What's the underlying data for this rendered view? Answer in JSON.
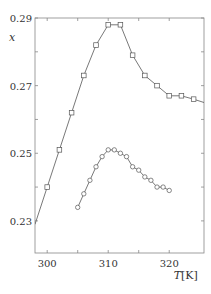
{
  "chart_data": {
    "type": "line",
    "title": "",
    "xlabel": "T",
    "xlabel_unit": "[K]",
    "ylabel": "x",
    "xlim": [
      298,
      325.7
    ],
    "ylim": [
      0.2205,
      0.29
    ],
    "xticks": [
      300,
      310,
      320
    ],
    "xtick_labels": [
      "300",
      "310",
      "320"
    ],
    "xminor_ticks": [
      305,
      315
    ],
    "yticks": [
      0.23,
      0.25,
      0.27,
      0.29
    ],
    "ytick_labels": [
      "0.23",
      "0.25",
      "0.27",
      "0.29"
    ],
    "yminor_ticks": [
      0.24,
      0.26,
      0.28
    ],
    "grid": false,
    "legend": null,
    "series": [
      {
        "name": "upper",
        "marker": "square",
        "color": "#555555",
        "x": [
          298,
          300,
          302,
          304,
          306,
          308,
          310,
          312,
          314,
          316,
          318,
          320,
          322,
          324,
          325.7
        ],
        "y": [
          0.229,
          0.24,
          0.251,
          0.262,
          0.273,
          0.282,
          0.288,
          0.288,
          0.279,
          0.273,
          0.27,
          0.267,
          0.267,
          0.266,
          0.265
        ],
        "markers_at": [
          300,
          302,
          304,
          306,
          308,
          310,
          312,
          314,
          316,
          318,
          320,
          322,
          324
        ]
      },
      {
        "name": "lower",
        "marker": "circle",
        "color": "#555555",
        "x": [
          305,
          306,
          307,
          308,
          309,
          310,
          311,
          312,
          313,
          314,
          315,
          316,
          317,
          318,
          319,
          320
        ],
        "y": [
          0.234,
          0.238,
          0.242,
          0.246,
          0.249,
          0.251,
          0.251,
          0.25,
          0.249,
          0.246,
          0.245,
          0.243,
          0.242,
          0.24,
          0.24,
          0.239
        ],
        "markers_at": [
          305,
          306,
          307,
          308,
          309,
          310,
          311,
          312,
          313,
          314,
          315,
          316,
          317,
          318,
          319,
          320
        ]
      }
    ]
  },
  "plot_area": {
    "left": 35,
    "top": 18,
    "right": 204,
    "bottom": 253
  }
}
